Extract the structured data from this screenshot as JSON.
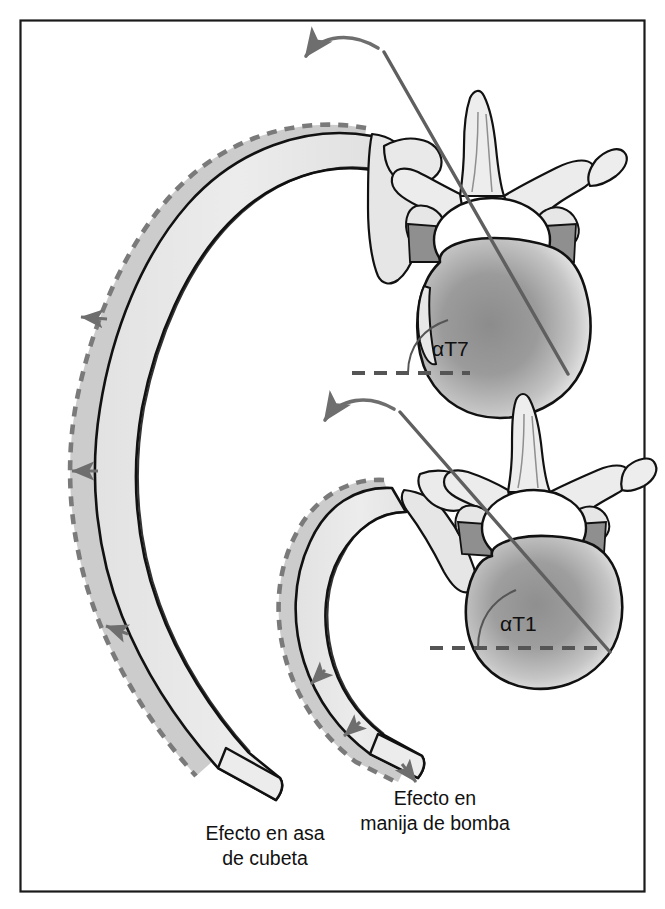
{
  "figure": {
    "title_visible": false,
    "frame": {
      "stroke": "#1a1a1a",
      "x": 20,
      "y": 20,
      "width": 625,
      "height": 872
    },
    "background": "#ffffff"
  },
  "colors": {
    "bone_fill": "#e8e8e8",
    "bone_fill_light": "#efefef",
    "bone_outline": "#111111",
    "displaced_fill": "#c9c9c9",
    "dashed_stroke": "#7a7a7a",
    "arrow_gray": "#6e6e6e",
    "axis_line": "#5f5f5f",
    "body_shadow_dark": "#8d8d8d",
    "body_shadow_mid": "#a9a9a9",
    "disc_gray": "#9a9a9a",
    "text": "#111111"
  },
  "captions": [
    {
      "id": "bucket-handle",
      "lines": [
        "Efecto en asa",
        "de cubeta"
      ],
      "x": 265,
      "y_first": 840,
      "line_height": 25
    },
    {
      "id": "pump-handle",
      "lines": [
        "Efecto en",
        "manija de bomba"
      ],
      "x": 435,
      "y_first": 805,
      "line_height": 25
    }
  ],
  "angle_labels": [
    {
      "id": "alpha-t7",
      "text": "αT7",
      "x": 432,
      "y": 356
    },
    {
      "id": "alpha-t1",
      "text": "αT1",
      "x": 500,
      "y": 631
    }
  ],
  "panels": [
    {
      "id": "upper-panel",
      "vertebra_level": "T7",
      "effect": "bucket-handle",
      "angle_label": "αT7",
      "reference_line": "horizontal-dashed",
      "rotation_arrow_direction": "counterclockwise-down-left"
    },
    {
      "id": "lower-panel",
      "vertebra_level": "T1",
      "effect": "pump-handle",
      "angle_label": "αT1",
      "reference_line": "horizontal-dashed",
      "rotation_arrow_direction": "counterclockwise-down-left"
    }
  ],
  "annotations": {
    "displacement_arrow_count_left_rib": 3,
    "displacement_arrow_count_right_rib": 3,
    "dashed_outline_meaning": "posicion desplazada de la costilla"
  }
}
